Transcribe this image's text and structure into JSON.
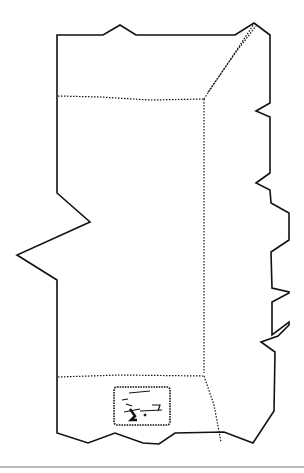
{
  "figure": {
    "description": "Line drawing of an unfolded package/box panel with jagged torn edges, dotted fold lines, and a small printed label",
    "stroke_color": "#111111",
    "background": "#ffffff",
    "label_text": ""
  }
}
